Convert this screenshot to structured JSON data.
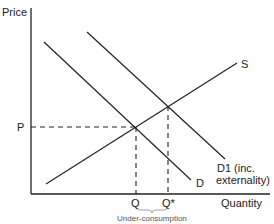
{
  "diagram": {
    "y_axis_label": "Price",
    "x_axis_label": "Quantity",
    "price_label": "P",
    "quantity_label": "Q",
    "quantity_star_label": "Q*",
    "brace_label": "Under-consumption",
    "curves": {
      "supply": "S",
      "demand": "D",
      "demand1_line1": "D1 (inc.",
      "demand1_line2": "externality)"
    },
    "colors": {
      "line": "#222222",
      "background": "#ffffff",
      "brace": "#999999"
    }
  }
}
